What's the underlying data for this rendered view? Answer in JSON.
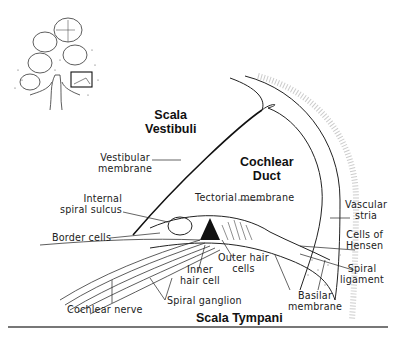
{
  "figure": {
    "inset": {
      "description": "cochlea cross-section with highlighted region box"
    },
    "regions": {
      "scala_vestibuli": [
        "Scala",
        "Vestibuli"
      ],
      "cochlear_duct": [
        "Cochlear",
        "Duct"
      ],
      "scala_tympani": "Scala Tympani"
    },
    "labels": {
      "vestibular_membrane": [
        "Vestibular",
        "membrane"
      ],
      "internal_spiral_sulcus": [
        "Internal",
        "spiral sulcus"
      ],
      "border_cells": "Border cells",
      "tectorial_membrane": "Tectorial membrane",
      "vascular_stria": [
        "Vascular",
        "stria"
      ],
      "cells_of_hensen": [
        "Cells of",
        "Hensen"
      ],
      "spiral_ligament": [
        "Spiral",
        "ligament"
      ],
      "outer_hair_cells": [
        "Outer hair",
        "cells"
      ],
      "inner_hair_cell": [
        "Inner",
        "hair cell"
      ],
      "basilar_membrane": [
        "Basilar",
        "membrane"
      ],
      "spiral_ganglion": "Spiral ganglion",
      "cochlear_nerve": "Cochlear nerve"
    },
    "colors": {
      "ink": "#222222",
      "rule": "#777777",
      "stipple": "#888888"
    }
  }
}
